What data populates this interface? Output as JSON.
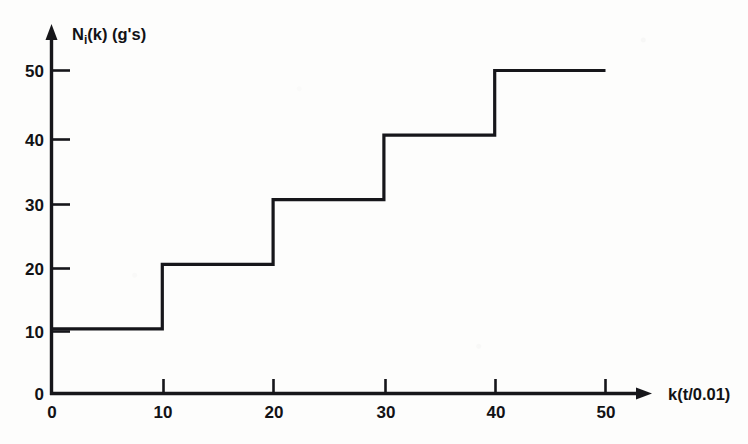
{
  "chart_data": {
    "type": "line",
    "title": "",
    "subtitle": "",
    "xlabel": "k(t/0.01)",
    "ylabel": "N_i(k) (g's)",
    "ylabel_parts": {
      "main": "N",
      "subscript": "i",
      "rest": "(k) (g's)"
    },
    "step_style": "post",
    "xlim": [
      0,
      50
    ],
    "ylim": [
      0,
      50
    ],
    "grid": false,
    "legend": "none",
    "x_ticks": [
      0,
      10,
      20,
      30,
      40,
      50
    ],
    "y_ticks": [
      0,
      10,
      20,
      30,
      40,
      50
    ],
    "x_tick_labels": [
      "0",
      "10",
      "20",
      "30",
      "40",
      "50"
    ],
    "y_tick_labels": [
      "0",
      "10",
      "20",
      "30",
      "40",
      "50"
    ],
    "series": [
      {
        "name": "N_i(k)",
        "color": "#16161a",
        "x": [
          0,
          10,
          20,
          30,
          40,
          50
        ],
        "values": [
          10,
          20,
          30,
          40,
          50,
          50
        ],
        "segments": [
          {
            "x_start": 0,
            "x_end": 10,
            "y": 10
          },
          {
            "x_start": 10,
            "x_end": 20,
            "y": 20
          },
          {
            "x_start": 20,
            "x_end": 30,
            "y": 30
          },
          {
            "x_start": 30,
            "x_end": 40,
            "y": 40
          },
          {
            "x_start": 40,
            "x_end": 50,
            "y": 50
          }
        ]
      }
    ],
    "annotations": []
  },
  "axes": {
    "y_axis_name": "vertical-axis",
    "x_axis_name": "horizontal-axis",
    "y_arrow": "up-arrow",
    "x_arrow": "right-arrow"
  }
}
